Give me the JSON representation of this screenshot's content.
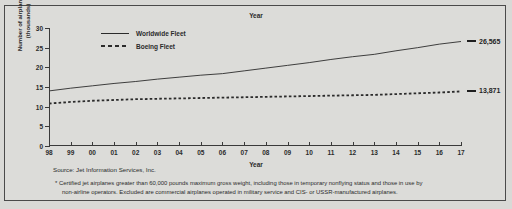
{
  "chart_data": {
    "type": "line",
    "title": "Year",
    "xlabel": "Year",
    "ylabel": "Number of airplanes* (thousands)",
    "ylim": [
      0,
      30
    ],
    "yticks": [
      0,
      5,
      10,
      15,
      20,
      25,
      30
    ],
    "grid": false,
    "legend_position": "top-left-inside",
    "x": [
      "98",
      "99",
      "00",
      "01",
      "02",
      "03",
      "04",
      "05",
      "06",
      "07",
      "08",
      "09",
      "10",
      "11",
      "12",
      "13",
      "14",
      "15",
      "16",
      "17"
    ],
    "series": [
      {
        "name": "Worldwide Fleet",
        "style": "solid",
        "values": [
          14.0,
          14.7,
          15.3,
          15.9,
          16.4,
          17.0,
          17.5,
          18.0,
          18.4,
          19.1,
          19.8,
          20.5,
          21.2,
          22.0,
          22.7,
          23.3,
          24.2,
          25.0,
          25.9,
          26.565
        ],
        "end_label": "26,565"
      },
      {
        "name": "Boeing Fleet",
        "style": "dashed",
        "values": [
          10.8,
          11.2,
          11.5,
          11.7,
          11.9,
          12.0,
          12.1,
          12.2,
          12.3,
          12.4,
          12.5,
          12.6,
          12.7,
          12.8,
          12.9,
          13.0,
          13.2,
          13.4,
          13.6,
          13.871
        ],
        "end_label": "13,871"
      }
    ],
    "annotations": [
      {
        "text": "26,565",
        "series": "Worldwide Fleet"
      },
      {
        "text": "13,871",
        "series": "Boeing Fleet"
      }
    ]
  },
  "ylabel_lines": [
    "Number of airplanes*",
    "(thousands)"
  ],
  "footer": {
    "source": "Source: Jet Information Services, Inc.",
    "footnote_line1": "* Certified jet airplanes greater than 60,000 pounds maximum gross weight, including those in temporary nonflying status and those in use by",
    "footnote_line2": "non-airline operators. Excluded are commercial airplanes operated in military service and CIS- or USSR-manufactured airplanes."
  },
  "colors": {
    "page_background": "#d9d9d6",
    "frame_border": "#4a4a4a",
    "ink": "#2b2b2b"
  }
}
